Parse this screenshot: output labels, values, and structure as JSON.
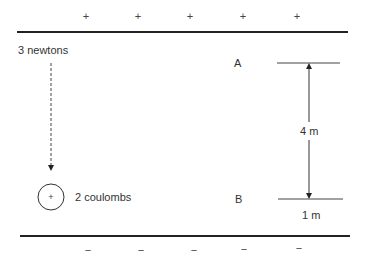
{
  "diagram": {
    "top_plate": {
      "charge_sign": "+",
      "signs": [
        "+",
        "+",
        "+",
        "+",
        "+"
      ]
    },
    "bottom_plate": {
      "charge_sign": "−",
      "signs": [
        "−",
        "−",
        "−",
        "−",
        "−"
      ]
    },
    "force_label": "3 newtons",
    "charge": {
      "symbol": "+",
      "label": "2 coulombs"
    },
    "points": {
      "a_label": "A",
      "b_label": "B"
    },
    "distance_label": "4 m",
    "width_label": "1 m",
    "colors": {
      "line": "#222222",
      "text": "#333333"
    }
  }
}
